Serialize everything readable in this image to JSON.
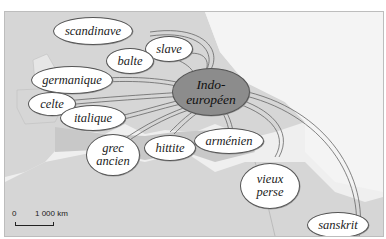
{
  "map": {
    "title": "Indo-européen language family map",
    "center": {
      "label_line1": "Indo-",
      "label_line2": "européen"
    },
    "languages": [
      {
        "id": "scandinave",
        "label": "scandinave"
      },
      {
        "id": "slave",
        "label": "slave"
      },
      {
        "id": "balte",
        "label": "balte"
      },
      {
        "id": "germanique",
        "label": "germanique"
      },
      {
        "id": "celte",
        "label": "celte"
      },
      {
        "id": "italique",
        "label": "italique"
      },
      {
        "id": "grec-ancien",
        "label_line1": "grec",
        "label_line2": "ancien"
      },
      {
        "id": "hittite",
        "label": "hittite"
      },
      {
        "id": "armenien",
        "label": "arménien"
      },
      {
        "id": "vieux-perse",
        "label_line1": "vieux",
        "label_line2": "perse"
      },
      {
        "id": "sanskrit",
        "label": "sanskrit"
      }
    ],
    "scale": {
      "zero": "0",
      "distance": "1 000 km"
    },
    "colors": {
      "land": "#d6d6d6",
      "sea": "#efefef",
      "center_fill": "#8c8c8c",
      "bubble_fill": "#ffffff",
      "border": "#555555"
    }
  }
}
